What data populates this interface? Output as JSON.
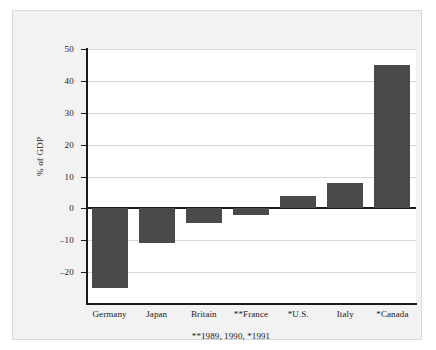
{
  "chart_data": {
    "type": "bar",
    "title": "",
    "subtitle": "",
    "xlabel": "",
    "ylabel": "% of GDP",
    "categories": [
      "Germany",
      "Japan",
      "Britain",
      "**France",
      "*U.S.",
      "Italy",
      "*Canada"
    ],
    "values": [
      -25,
      -11,
      -4.5,
      -2.2,
      4,
      8,
      45
    ],
    "ylim": [
      -30,
      50
    ],
    "yticks": [
      50,
      40,
      30,
      20,
      10,
      0,
      -10,
      -20
    ],
    "ytick_labels": [
      "50",
      "40",
      "30",
      "20",
      "10",
      "0",
      "–10",
      "–20"
    ],
    "grid": "horizontal",
    "legend": "none",
    "annotations": [
      "**1989, 1990, *1991"
    ],
    "bar_color": "#4a4a4a",
    "zero_line_color": "#1a1a1a",
    "grid_color": "#d6d6d6",
    "plot_background": "#ffffff",
    "panel_background": "#f2f2f2"
  },
  "footnote": "**1989, 1990, *1991"
}
